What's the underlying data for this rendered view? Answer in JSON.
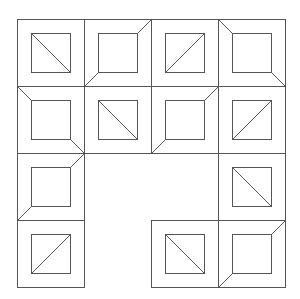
{
  "canvas": {
    "width": 300,
    "height": 299,
    "background": "#ffffff"
  },
  "style": {
    "stroke": "#555555",
    "stroke_width": 1
  },
  "grid": {
    "origin_x": 17,
    "origin_y": 19,
    "tile_size": 67,
    "inner_inset": 14,
    "inner_size": 39,
    "rows": 4,
    "cols": 4
  },
  "tiles": [
    {
      "row": 0,
      "col": 0,
      "type": "diagonal",
      "direction": "backslash"
    },
    {
      "row": 0,
      "col": 1,
      "type": "bevel",
      "corners": [
        "top-right",
        "bottom-left"
      ]
    },
    {
      "row": 0,
      "col": 2,
      "type": "diagonal",
      "direction": "slash"
    },
    {
      "row": 0,
      "col": 3,
      "type": "bevel",
      "corners": [
        "top-left",
        "bottom-right"
      ]
    },
    {
      "row": 1,
      "col": 0,
      "type": "bevel",
      "corners": [
        "top-left",
        "bottom-right"
      ]
    },
    {
      "row": 1,
      "col": 1,
      "type": "diagonal",
      "direction": "backslash"
    },
    {
      "row": 1,
      "col": 2,
      "type": "bevel",
      "corners": [
        "top-right",
        "bottom-left"
      ]
    },
    {
      "row": 1,
      "col": 3,
      "type": "diagonal",
      "direction": "slash"
    },
    {
      "row": 2,
      "col": 0,
      "type": "bevel",
      "corners": [
        "top-right",
        "bottom-left"
      ]
    },
    {
      "row": 2,
      "col": 3,
      "type": "diagonal",
      "direction": "backslash"
    },
    {
      "row": 3,
      "col": 0,
      "type": "diagonal",
      "direction": "slash"
    },
    {
      "row": 3,
      "col": 2,
      "type": "diagonal",
      "direction": "backslash"
    },
    {
      "row": 3,
      "col": 3,
      "type": "bevel",
      "corners": [
        "top-right",
        "bottom-left"
      ]
    }
  ],
  "empty_cells": [
    {
      "row": 2,
      "col": 1
    },
    {
      "row": 2,
      "col": 2
    },
    {
      "row": 3,
      "col": 1
    }
  ]
}
